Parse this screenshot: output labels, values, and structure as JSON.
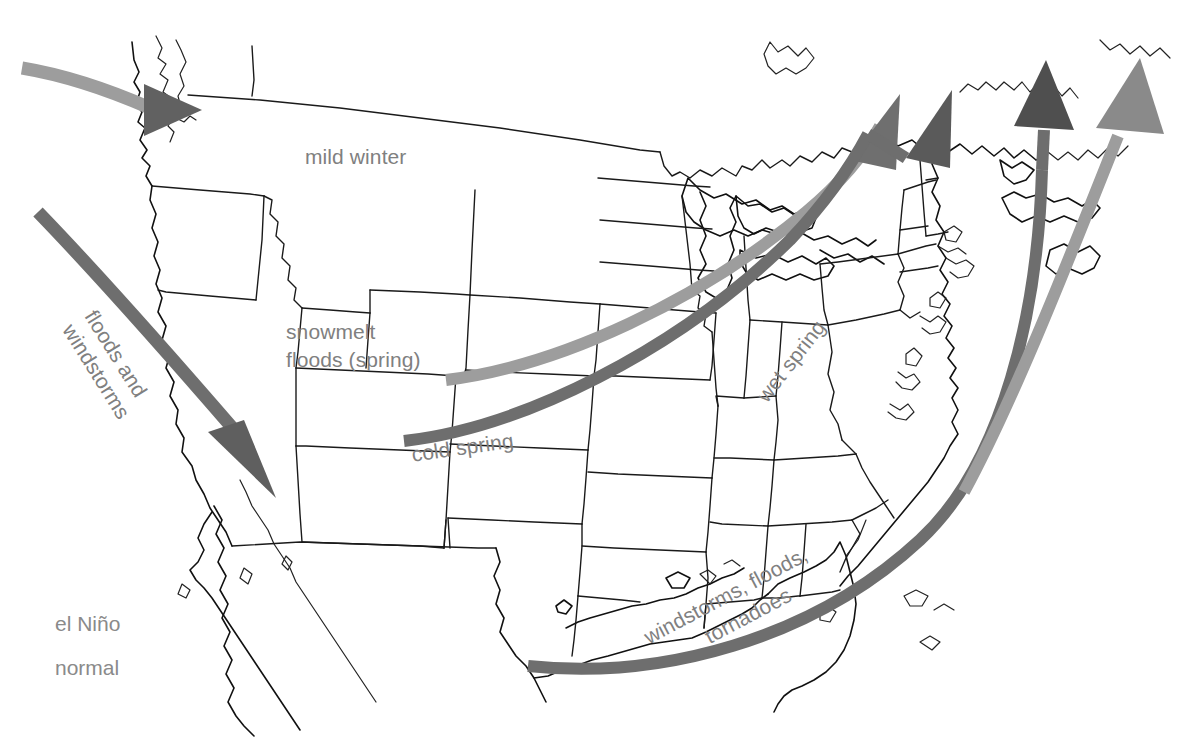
{
  "figure": {
    "kind": "climate-map",
    "region": "United States and adjacent North America"
  },
  "legend": {
    "items": [
      {
        "key": "el-nino",
        "label": "el Niño",
        "color": "#5d5d5d",
        "meaning": "storm track during el Niño conditions"
      },
      {
        "key": "normal",
        "label": "normal",
        "color": "#9d9d9d",
        "meaning": "storm track during normal conditions"
      }
    ]
  },
  "annotations": [
    {
      "id": "mild-winter",
      "text": "mild winter",
      "rotation": 0,
      "color": "#808080"
    },
    {
      "id": "snowmelt-floods",
      "text": "snowmelt\nfloods (spring)",
      "rotation": 0,
      "color": "#808080"
    },
    {
      "id": "floods-windstorms",
      "text": "floods and\nwindstorms",
      "rotation": 58,
      "color": "#808080"
    },
    {
      "id": "cold-spring",
      "text": "cold spring",
      "rotation": -8,
      "color": "#808080"
    },
    {
      "id": "wet-spring",
      "text": "wet spring",
      "rotation": -52,
      "color": "#808080"
    },
    {
      "id": "windstorms-floods-tornadoes",
      "text": "windstorms, floods,\ntornadoes",
      "rotation": -28,
      "color": "#808080"
    }
  ],
  "label_text": {
    "mild_winter": "mild winter",
    "snowmelt_line1": "snowmelt",
    "snowmelt_line2": "floods (spring)",
    "floods_line1": "floods and",
    "floods_line2": "windstorms",
    "cold_spring": "cold spring",
    "wet_spring": "wet spring",
    "windstorms_floods": "windstorms, floods,",
    "tornadoes": "tornadoes",
    "legend_el_nino": "el Niño",
    "legend_normal": "normal"
  },
  "arrows": [
    {
      "id": "pacific-northwest-normal",
      "track": "normal",
      "color": "#9d9d9d",
      "head_color": "#5d5d5d",
      "start": [
        28,
        70
      ],
      "end": [
        196,
        110
      ],
      "note": "enters Pacific Northwest, mild winter"
    },
    {
      "id": "southwest-elnino",
      "track": "el-nino",
      "color": "#6e6e6e",
      "head_color": "#5d5d5d",
      "start": [
        40,
        213
      ],
      "end": [
        272,
        497
      ],
      "note": "el Niño southern track bringing floods and windstorms to California / Southwest"
    },
    {
      "id": "central-normal",
      "track": "normal",
      "color": "#9d9d9d",
      "head_color": "#6f6f6f",
      "start": [
        448,
        378
      ],
      "end": [
        896,
        96
      ],
      "note": "normal track across the Plains to the Northeast"
    },
    {
      "id": "central-elnino",
      "track": "el-nino",
      "color": "#6e6e6e",
      "head_color": "#5a5a5a",
      "start": [
        406,
        440
      ],
      "end": [
        950,
        92
      ],
      "note": "el Niño track: cold spring, wet spring"
    },
    {
      "id": "gulf-elnino",
      "track": "el-nino",
      "color": "#6e6e6e",
      "head_color": "#4f4f4f",
      "start": [
        530,
        666
      ],
      "end": [
        1046,
        62
      ],
      "note": "Gulf storm track: windstorms, floods, tornadoes"
    },
    {
      "id": "atlantic-normal",
      "track": "normal",
      "color": "#9d9d9d",
      "head_color": "#8a8a8a",
      "start": [
        966,
        492
      ],
      "end": [
        1140,
        60
      ],
      "note": "offshore Atlantic normal track"
    }
  ],
  "colors": {
    "background": "#ffffff",
    "outline": "#111111",
    "label_gray": "#808080",
    "arrow_light": "#9d9d9d",
    "arrow_dark": "#6e6e6e",
    "arrow_head_dark": "#585858"
  }
}
